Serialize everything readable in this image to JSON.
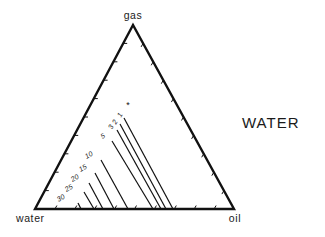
{
  "diagram": {
    "type": "ternary",
    "title": "WATER",
    "vertices": {
      "top": {
        "label": "gas",
        "x": 133,
        "y": 25
      },
      "bottom_left": {
        "label": "water",
        "x": 35,
        "y": 209
      },
      "bottom_right": {
        "label": "oil",
        "x": 234,
        "y": 209
      }
    },
    "marker": {
      "symbol": "*",
      "x": 128,
      "y": 108
    },
    "ticks_per_edge": 10,
    "contours": [
      {
        "label": "1",
        "x1": 124,
        "y1": 118,
        "x2": 173,
        "y2": 209,
        "lx": 122,
        "ly": 116,
        "rot": -62
      },
      {
        "label": "2",
        "x1": 120,
        "y1": 124,
        "x2": 166,
        "y2": 209,
        "lx": 117,
        "ly": 123,
        "rot": -62
      },
      {
        "label": "3",
        "x1": 117,
        "y1": 130,
        "x2": 161,
        "y2": 209,
        "lx": 113,
        "ly": 128,
        "rot": -62
      },
      {
        "label": "5",
        "x1": 112,
        "y1": 141,
        "x2": 153,
        "y2": 209,
        "lx": 104,
        "ly": 138,
        "rot": -30
      },
      {
        "label": "10",
        "x1": 101,
        "y1": 160,
        "x2": 128,
        "y2": 209,
        "lx": 90,
        "ly": 157,
        "rot": -30
      },
      {
        "label": "15",
        "x1": 95,
        "y1": 173,
        "x2": 114,
        "y2": 209,
        "lx": 84,
        "ly": 170,
        "rot": -30
      },
      {
        "label": "20",
        "x1": 89,
        "y1": 183,
        "x2": 103,
        "y2": 209,
        "lx": 76,
        "ly": 180,
        "rot": -30
      },
      {
        "label": "25",
        "x1": 84,
        "y1": 192,
        "x2": 94,
        "y2": 209,
        "lx": 70,
        "ly": 190,
        "rot": -30
      },
      {
        "label": "30",
        "x1": 78,
        "y1": 203,
        "x2": 81,
        "y2": 209,
        "lx": 62,
        "ly": 200,
        "rot": -30
      }
    ],
    "colors": {
      "line": "#111111",
      "background": "#ffffff"
    }
  }
}
